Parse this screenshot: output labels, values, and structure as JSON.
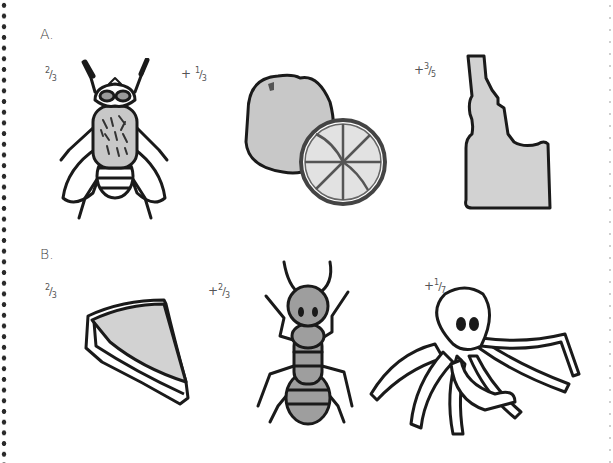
{
  "worksheet": {
    "section_a": {
      "label": "A.",
      "terms": [
        {
          "operator": "",
          "numerator": "2",
          "denominator": "3",
          "picture": "fly"
        },
        {
          "operator": "+",
          "numerator": "1",
          "denominator": "3",
          "picture": "orange"
        },
        {
          "operator": "+",
          "numerator": "3",
          "denominator": "5",
          "picture": "idaho-state"
        }
      ]
    },
    "section_b": {
      "label": "B.",
      "terms": [
        {
          "operator": "",
          "numerator": "2",
          "denominator": "3",
          "picture": "pie-slice"
        },
        {
          "operator": "+",
          "numerator": "2",
          "denominator": "3",
          "picture": "ant"
        },
        {
          "operator": "+",
          "numerator": "1",
          "denominator": "7",
          "picture": "octopus"
        }
      ]
    },
    "colors": {
      "fill_gray": "#c8c8c8",
      "outline": "#1a1a1a",
      "dots": "#2a2a2a"
    }
  }
}
